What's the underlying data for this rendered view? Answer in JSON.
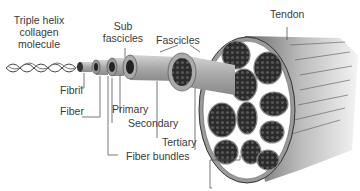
{
  "diagram": {
    "labels": {
      "collagen_line1": "Triple helix",
      "collagen_line2": "collagen",
      "collagen_line3": "molecule",
      "sub_line1": "Sub",
      "sub_line2": "fascicles",
      "fascicles": "Fascicles",
      "tendon": "Tendon",
      "fibril": "Fibril",
      "fiber": "Fiber",
      "primary": "Primary",
      "secondary": "Secondary",
      "tertiary": "Tertiary",
      "fiber_bundles": "Fiber bundles"
    },
    "hierarchy": [
      "Triple helix collagen molecule",
      "Fibril",
      "Fiber",
      "Primary",
      "Secondary",
      "Tertiary",
      "Fascicles",
      "Tendon"
    ],
    "colors": {
      "line": "#555555",
      "sheath_light": "#bdbdbd",
      "sheath_mid": "#9a9a9a",
      "bundle_dark": "#2a2a2a",
      "text": "#3a3a3a"
    }
  }
}
